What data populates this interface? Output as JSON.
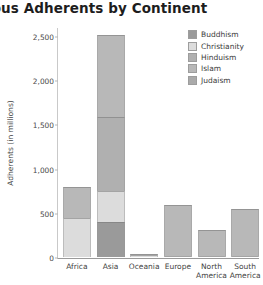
{
  "title": "Religious Adherents by Continent",
  "chart_data": {
    "type": "bar",
    "subtype": "stacked-vertical",
    "title": "Religious Adherents by Continent",
    "xlabel": "",
    "ylabel": "Adherents (in millions)",
    "ylim": [
      0,
      2600
    ],
    "yticks": [
      0,
      500,
      1000,
      1500,
      2000,
      2500
    ],
    "ytick_labels": [
      "0",
      "500",
      "1,000",
      "1,500",
      "2,000",
      "2,500"
    ],
    "grid": false,
    "legend_position": "top-right",
    "categories": [
      "Africa",
      "Asia",
      "Oceania",
      "Europe",
      "North\nAmerica",
      "South\nAmerica"
    ],
    "series": [
      {
        "name": "Buddhism",
        "color": "#9a9a9a",
        "values": [
          0,
          400,
          0,
          0,
          0,
          0
        ]
      },
      {
        "name": "Christianity",
        "color": "#dcdcdc",
        "values": [
          440,
          350,
          20,
          15,
          10,
          10
        ]
      },
      {
        "name": "Hinduism",
        "color": "#b0b0b0",
        "values": [
          0,
          830,
          0,
          0,
          0,
          0
        ]
      },
      {
        "name": "Islam",
        "color": "#b8b8b8",
        "values": [
          350,
          930,
          5,
          575,
          290,
          530
        ]
      },
      {
        "name": "Judaism",
        "color": "#aaaaaa",
        "values": [
          0,
          0,
          0,
          0,
          0,
          0
        ]
      }
    ],
    "totals": [
      790,
      2510,
      25,
      590,
      300,
      540
    ]
  },
  "legend": {
    "items": [
      {
        "label": "Buddhism",
        "color": "#9a9a9a"
      },
      {
        "label": "Christianity",
        "color": "#dcdcdc"
      },
      {
        "label": "Hinduism",
        "color": "#b0b0b0"
      },
      {
        "label": "Islam",
        "color": "#b8b8b8"
      },
      {
        "label": "Judaism",
        "color": "#aaaaaa"
      }
    ]
  }
}
